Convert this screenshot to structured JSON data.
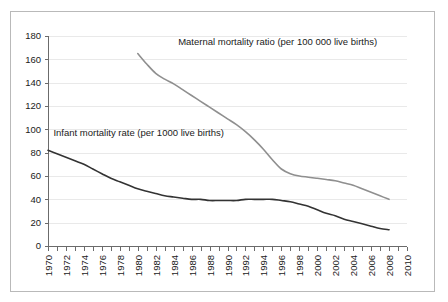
{
  "chart_data": {
    "type": "line",
    "title": "",
    "xlabel": "",
    "ylabel": "",
    "xlim": [
      1970,
      2010
    ],
    "ylim": [
      0,
      180
    ],
    "grid": true,
    "legend_position": "inline-annotation",
    "y_ticks": [
      0,
      20,
      40,
      60,
      80,
      100,
      120,
      140,
      160,
      180
    ],
    "x_ticks": [
      1970,
      1972,
      1974,
      1976,
      1978,
      1980,
      1982,
      1984,
      1986,
      1988,
      1990,
      1992,
      1994,
      1996,
      1998,
      2000,
      2002,
      2004,
      2006,
      2008,
      2010
    ],
    "x_tick_labels": [
      "1970",
      "1972",
      "1974",
      "1976",
      "1978",
      "1980",
      "1982",
      "1984",
      "1986",
      "1988",
      "1990",
      "1992",
      "1994",
      "1996",
      "1998",
      "2000",
      "2002",
      "2004",
      "2006",
      "2008",
      "2010"
    ],
    "y_tick_labels": [
      "0",
      "20",
      "40",
      "60",
      "80",
      "100",
      "120",
      "140",
      "160",
      "180"
    ],
    "annotations": [
      {
        "name": "maternal-series-label",
        "text": "Maternal mortality ratio (per 100 000 live births)",
        "x": 1984.5,
        "y": 172
      },
      {
        "name": "infant-series-label",
        "text": "Infant mortality rate (per 1000 live births)",
        "x": 1970.6,
        "y": 94
      }
    ],
    "series": [
      {
        "name": "Maternal mortality ratio (per 100 000 live births)",
        "short_name": "maternal-mortality-ratio",
        "color": "#8f8f8f",
        "x": [
          1980,
          1981,
          1982,
          1983,
          1984,
          1985,
          1986,
          1987,
          1988,
          1989,
          1990,
          1991,
          1992,
          1993,
          1994,
          1995,
          1996,
          1997,
          1998,
          1999,
          2000,
          2001,
          2002,
          2003,
          2004,
          2005,
          2006,
          2007,
          2008
        ],
        "values": [
          165,
          156,
          148,
          143,
          139,
          134,
          129,
          124,
          119,
          114,
          109,
          104,
          98,
          91,
          83,
          74,
          66,
          62,
          60,
          59,
          58,
          57,
          56,
          54,
          52,
          49,
          46,
          43,
          40
        ]
      },
      {
        "name": "Infant mortality rate (per 1000 live births)",
        "short_name": "infant-mortality-rate",
        "color": "#333333",
        "x": [
          1970,
          1971,
          1972,
          1973,
          1974,
          1975,
          1976,
          1977,
          1978,
          1979,
          1980,
          1981,
          1982,
          1983,
          1984,
          1985,
          1986,
          1987,
          1988,
          1989,
          1990,
          1991,
          1992,
          1993,
          1994,
          1995,
          1996,
          1997,
          1998,
          1999,
          2000,
          2001,
          2002,
          2003,
          2004,
          2005,
          2006,
          2007,
          2008
        ],
        "values": [
          82,
          79,
          76,
          73,
          70,
          66,
          62,
          58,
          55,
          52,
          49,
          47,
          45,
          43,
          42,
          41,
          40,
          40,
          39,
          39,
          39,
          39,
          40,
          40,
          40,
          40,
          39,
          38,
          36,
          34,
          31,
          28,
          26,
          23,
          21,
          19,
          17,
          15,
          14
        ]
      }
    ]
  }
}
